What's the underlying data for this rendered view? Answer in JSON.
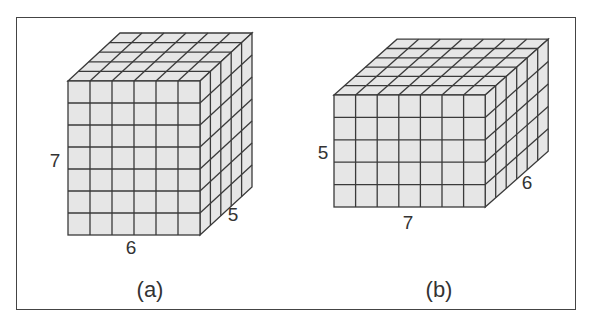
{
  "figures": [
    {
      "id": "a",
      "caption": "(a)",
      "dimensions": {
        "width": 6,
        "height": 7,
        "depth": 5
      },
      "labels": {
        "height": "7",
        "width": "6",
        "depth": "5"
      },
      "geometry": {
        "x": 68,
        "y": 81,
        "cell_w": 22,
        "cell_h": 22,
        "dx": 10.4,
        "dy": -9.6
      },
      "label_pos": {
        "height": [
          55,
          160
        ],
        "width": [
          131,
          247
        ],
        "depth": [
          233,
          214
        ],
        "caption": [
          150,
          290
        ]
      }
    },
    {
      "id": "b",
      "caption": "(b)",
      "dimensions": {
        "width": 7,
        "height": 5,
        "depth": 6
      },
      "labels": {
        "height": "5",
        "width": "7",
        "depth": "6"
      },
      "geometry": {
        "x": 334,
        "y": 95,
        "cell_w": 21.6,
        "cell_h": 22.4,
        "dx": 10.5,
        "dy": -9.3
      },
      "label_pos": {
        "height": [
          323,
          152
        ],
        "width": [
          408,
          222
        ],
        "depth": [
          527,
          182
        ],
        "caption": [
          439,
          290
        ]
      }
    }
  ],
  "colors": {
    "fill": "#e6e6e6",
    "line": "#3a3a3a",
    "frame": "#444444"
  }
}
